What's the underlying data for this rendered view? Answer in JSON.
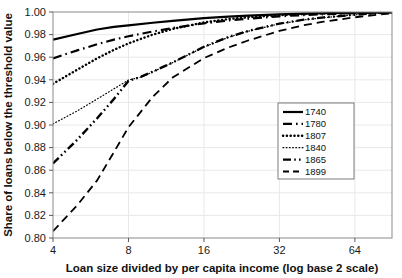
{
  "chart_data": {
    "type": "line",
    "title": "",
    "xlabel": "Loan size divided by per capita income (log base 2 scale)",
    "ylabel": "Share of loans below the threshold value",
    "xscale": "log2",
    "xlim": [
      4,
      90
    ],
    "ylim": [
      0.8,
      1.0
    ],
    "xticks": [
      4,
      8,
      16,
      32,
      64
    ],
    "xtick_labels": [
      "4",
      "8",
      "16",
      "32",
      "64"
    ],
    "yticks": [
      0.8,
      0.82,
      0.84,
      0.86,
      0.88,
      0.9,
      0.92,
      0.94,
      0.96,
      0.98,
      1.0
    ],
    "ytick_labels": [
      "0.80",
      "0.82",
      "0.84",
      "0.86",
      "0.88",
      "0.90",
      "0.92",
      "0.94",
      "0.96",
      "0.98",
      "1.00"
    ],
    "grid": true,
    "grid_color": "#e8e8e8",
    "legend_position": "right-middle",
    "series": [
      {
        "name": "1740",
        "dash_style": "solid",
        "color": "#000000",
        "width": 2.2,
        "x": [
          4,
          5,
          6,
          7,
          8,
          10,
          12,
          16,
          20,
          24,
          32,
          40,
          48,
          64,
          80,
          90
        ],
        "values": [
          0.9755,
          0.9805,
          0.9845,
          0.9868,
          0.9882,
          0.9905,
          0.9921,
          0.9945,
          0.9959,
          0.9968,
          0.9979,
          0.9985,
          0.9989,
          0.9995,
          0.9998,
          0.9999
        ]
      },
      {
        "name": "1780",
        "dash_style": "dash-dot",
        "color": "#000000",
        "width": 2.2,
        "x": [
          4,
          5,
          6,
          7,
          8,
          10,
          12,
          16,
          20,
          24,
          32,
          40,
          48,
          64,
          80,
          90
        ],
        "values": [
          0.959,
          0.966,
          0.9715,
          0.9755,
          0.9785,
          0.9828,
          0.9858,
          0.99,
          0.9925,
          0.9941,
          0.9962,
          0.9973,
          0.998,
          0.999,
          0.9996,
          0.9998
        ]
      },
      {
        "name": "1807",
        "dash_style": "dotted-thick",
        "color": "#000000",
        "width": 2.4,
        "x": [
          4,
          5,
          6,
          7,
          8,
          10,
          12,
          16,
          20,
          24,
          32,
          40,
          48,
          64,
          80,
          90
        ],
        "values": [
          0.9365,
          0.949,
          0.959,
          0.9665,
          0.9722,
          0.98,
          0.985,
          0.9908,
          0.9937,
          0.9953,
          0.9972,
          0.9981,
          0.9986,
          0.9993,
          0.9997,
          0.9999
        ]
      },
      {
        "name": "1840",
        "dash_style": "dotted-fine",
        "color": "#000000",
        "width": 1.2,
        "x": [
          4,
          5,
          6,
          7,
          8,
          9,
          10,
          12,
          16,
          20,
          24,
          32,
          40,
          48,
          64,
          80,
          90
        ],
        "values": [
          0.901,
          0.9125,
          0.923,
          0.932,
          0.9398,
          0.9425,
          0.947,
          0.9552,
          0.969,
          0.9775,
          0.983,
          0.9895,
          0.993,
          0.995,
          0.9975,
          0.999,
          0.9995
        ]
      },
      {
        "name": "1865",
        "dash_style": "dash-dot-dot",
        "color": "#000000",
        "width": 2.4,
        "x": [
          4,
          5,
          6,
          7,
          8,
          9,
          10,
          12,
          16,
          20,
          24,
          32,
          40,
          48,
          64,
          80,
          90
        ],
        "values": [
          0.866,
          0.887,
          0.906,
          0.923,
          0.939,
          0.9428,
          0.9472,
          0.9553,
          0.9692,
          0.9778,
          0.9832,
          0.9897,
          0.9932,
          0.9952,
          0.9976,
          0.9991,
          0.9996
        ]
      },
      {
        "name": "1899",
        "dash_style": "dashed",
        "color": "#000000",
        "width": 1.8,
        "x": [
          4,
          5,
          6,
          7,
          8,
          10,
          12,
          16,
          20,
          24,
          32,
          40,
          48,
          64,
          80,
          90
        ],
        "values": [
          0.806,
          0.829,
          0.851,
          0.876,
          0.898,
          0.925,
          0.942,
          0.9592,
          0.9685,
          0.9748,
          0.9832,
          0.9883,
          0.9914,
          0.9953,
          0.9978,
          0.9988
        ]
      }
    ]
  },
  "legend": {
    "entries": [
      {
        "label": "1740"
      },
      {
        "label": "1780"
      },
      {
        "label": "1807"
      },
      {
        "label": "1840"
      },
      {
        "label": "1865"
      },
      {
        "label": "1899"
      }
    ]
  }
}
